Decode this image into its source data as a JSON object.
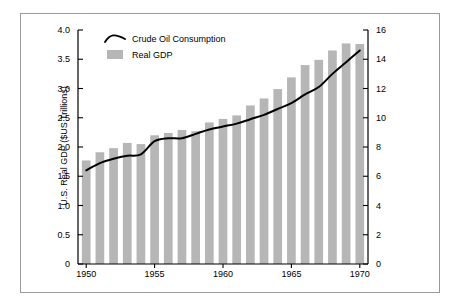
{
  "chart_data": {
    "type": "bar",
    "title": "",
    "xlabel": "",
    "ylabel": "U.S. Real GDP ($US Trillions)",
    "y2label": "Crude Oil Consumption (MMB/d)",
    "xlim": [
      1949.4,
      1970.6
    ],
    "ylim": [
      0,
      4.0
    ],
    "y2lim": [
      0,
      16
    ],
    "grid": false,
    "legend_position": "top-left-inside",
    "x_tick_labels": [
      "1950",
      "1955",
      "1960",
      "1965",
      "1970"
    ],
    "x_ticks": [
      1950,
      1955,
      1960,
      1965,
      1970
    ],
    "y_tick_labels": [
      "0",
      "0.5",
      "1.0",
      "1.5",
      "2.0",
      "2.5",
      "3.0",
      "3.5",
      "4.0"
    ],
    "y_ticks": [
      0,
      0.5,
      1.0,
      1.5,
      2.0,
      2.5,
      3.0,
      3.5,
      4.0
    ],
    "y2_tick_labels": [
      "0",
      "2",
      "4",
      "6",
      "8",
      "10",
      "12",
      "14",
      "16"
    ],
    "y2_ticks": [
      0,
      2,
      4,
      6,
      8,
      10,
      12,
      14,
      16
    ],
    "categories": [
      1950,
      1951,
      1952,
      1953,
      1954,
      1955,
      1956,
      1957,
      1958,
      1959,
      1960,
      1961,
      1962,
      1963,
      1964,
      1965,
      1966,
      1967,
      1968,
      1969,
      1970
    ],
    "series": [
      {
        "name": "Real GDP",
        "type": "bar",
        "axis": "left",
        "color": "#b6b6b6",
        "units": "$US Trillions",
        "values": [
          1.77,
          1.91,
          1.98,
          2.07,
          2.05,
          2.2,
          2.24,
          2.29,
          2.27,
          2.42,
          2.48,
          2.54,
          2.71,
          2.83,
          2.99,
          3.19,
          3.4,
          3.49,
          3.65,
          3.77,
          3.76
        ]
      },
      {
        "name": "Crude Oil Consumption",
        "type": "line",
        "axis": "right",
        "color": "#000000",
        "units": "MMB/d",
        "values": [
          6.4,
          6.9,
          7.2,
          7.4,
          7.5,
          8.4,
          8.6,
          8.6,
          8.9,
          9.2,
          9.4,
          9.6,
          9.9,
          10.2,
          10.6,
          11.0,
          11.6,
          12.1,
          13.0,
          13.8,
          14.6
        ]
      }
    ],
    "legend": [
      {
        "label": "Crude Oil Consumption",
        "marker": "line"
      },
      {
        "label": "Real GDP",
        "marker": "swatch"
      }
    ]
  }
}
